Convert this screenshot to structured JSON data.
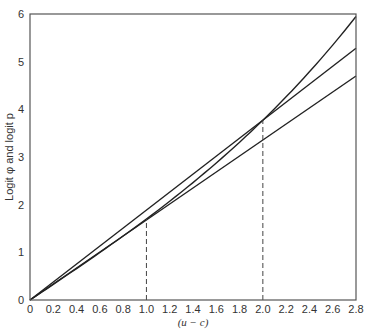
{
  "chart_data": {
    "type": "line",
    "title": "",
    "xlabel": "(u − c)",
    "ylabel": "Logit φ and logit p",
    "xlim": [
      0,
      2.8
    ],
    "ylim": [
      0,
      6
    ],
    "grid": false,
    "legend": null,
    "x_ticks": [
      "0",
      "0.2",
      "0.4",
      "0.6",
      "0.8",
      "1.0",
      "1.2",
      "1.4",
      "1.6",
      "1.8",
      "2.0",
      "2.2",
      "2.4",
      "2.6",
      "2.8"
    ],
    "y_ticks": [
      "0",
      "1",
      "2",
      "3",
      "4",
      "5",
      "6"
    ],
    "series": [
      {
        "name": "curve (logit)",
        "style": "solid",
        "x": [
          0,
          0.5,
          1.0,
          1.5,
          2.0,
          2.5,
          2.8
        ],
        "y": [
          0,
          0.83,
          1.7,
          2.67,
          3.77,
          5.07,
          5.95
        ]
      },
      {
        "name": "line tangent at 1.0",
        "style": "solid",
        "x": [
          0,
          2.8
        ],
        "y": [
          0,
          4.7
        ]
      },
      {
        "name": "line through 2.0",
        "style": "solid",
        "x": [
          0,
          2.8
        ],
        "y": [
          0,
          5.28
        ]
      }
    ],
    "annotations": [
      {
        "type": "dashed-vertical",
        "x": 1.0,
        "y_top": 1.7
      },
      {
        "type": "dashed-vertical",
        "x": 2.0,
        "y_top": 3.77
      }
    ]
  }
}
